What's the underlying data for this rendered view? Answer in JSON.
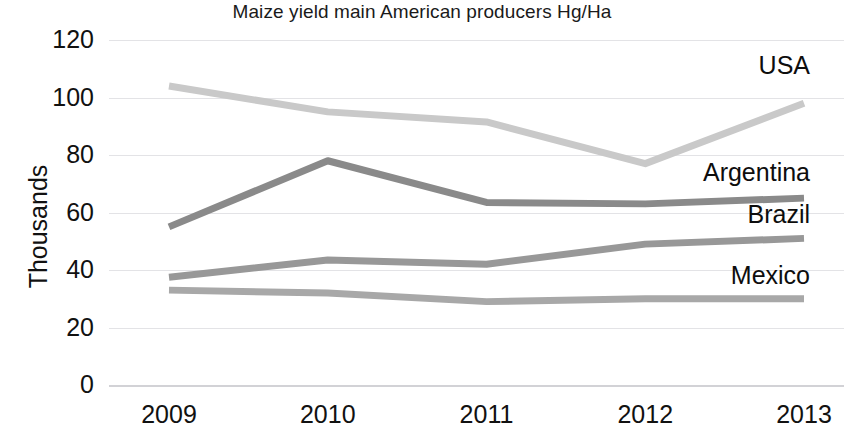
{
  "chart_data": {
    "type": "line",
    "title": "Maize yield main American producers Hg/Ha",
    "xlabel": "",
    "ylabel": "Thousands",
    "categories": [
      "2009",
      "2010",
      "2011",
      "2012",
      "2013"
    ],
    "x_tick_labels": [
      "2009",
      "2010",
      "2011",
      "2012",
      "2013"
    ],
    "y_tick_labels": [
      "0",
      "20",
      "40",
      "60",
      "80",
      "100",
      "120"
    ],
    "y_ticks": [
      0,
      20,
      40,
      60,
      80,
      100,
      120
    ],
    "ylim": [
      0,
      120
    ],
    "grid": true,
    "legend_position": "right-inline-labels",
    "series": [
      {
        "name": "USA",
        "label": "USA",
        "color": "#c9c9c9",
        "values": [
          104,
          95,
          91.5,
          77,
          98
        ]
      },
      {
        "name": "Argentina",
        "label": "Argentina",
        "color": "#8a8a8a",
        "values": [
          55,
          78,
          63.5,
          63,
          65
        ]
      },
      {
        "name": "Brazil",
        "label": "Brazil",
        "color": "#989898",
        "values": [
          37.5,
          43.5,
          42,
          49,
          51
        ]
      },
      {
        "name": "Mexico",
        "label": "Mexico",
        "color": "#a8a8a8",
        "values": [
          33,
          32,
          29,
          30,
          30
        ]
      }
    ]
  },
  "labels": {
    "usa": "USA",
    "argentina": "Argentina",
    "brazil": "Brazil",
    "mexico": "Mexico"
  }
}
